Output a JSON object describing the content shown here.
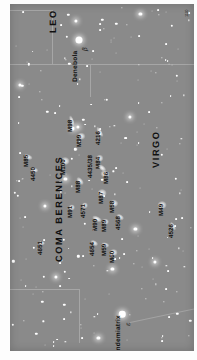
{
  "chart_data": {
    "type": "scatter",
    "xlabel": "",
    "ylabel": "",
    "grid": false,
    "legend": "none",
    "background_color": "#8a8a8a",
    "star_color": "#ffffff",
    "label_color": "#111111",
    "boundary_color": "#a6a6a6",
    "constellations": [
      {
        "name": "LEO",
        "x": 42,
        "y": 30
      },
      {
        "name": "COMA BERENICES",
        "x": 48,
        "y": 268
      },
      {
        "name": "VIRGO",
        "x": 152,
        "y": 170
      }
    ],
    "named_stars": [
      {
        "name": "Denebola",
        "greek": "β",
        "x": 74,
        "y": 37,
        "magnitude": 2.1,
        "size": 7.5
      },
      {
        "name": "Vindemiatrix",
        "greek": "ε",
        "x": 120,
        "y": 322,
        "magnitude": 2.8,
        "size": 7.0
      }
    ],
    "deep_sky_objects": [
      {
        "label": "M85",
        "x": 19,
        "y": 159,
        "gw": 7,
        "gh": 4,
        "rot": 20,
        "lx": 15,
        "ly": 169
      },
      {
        "label": "4450",
        "x": 26,
        "y": 172,
        "gw": 6,
        "gh": 4,
        "rot": 15,
        "lx": 22,
        "ly": 184
      },
      {
        "label": "4651",
        "x": 34,
        "y": 248,
        "gw": 5,
        "gh": 3,
        "rot": 10,
        "lx": 30,
        "ly": 260
      },
      {
        "label": "M98",
        "x": 66,
        "y": 121,
        "gw": 9,
        "gh": 3,
        "rot": 70,
        "lx": 62,
        "ly": 133
      },
      {
        "label": "M99",
        "x": 76,
        "y": 137,
        "gw": 6,
        "gh": 5,
        "rot": 0,
        "lx": 72,
        "ly": 148
      },
      {
        "label": "4216",
        "x": 96,
        "y": 133,
        "gw": 9,
        "gh": 3,
        "rot": 60,
        "lx": 92,
        "ly": 146
      },
      {
        "label": "M100",
        "x": 59,
        "y": 163,
        "gw": 7,
        "gh": 6,
        "rot": 0,
        "lx": 55,
        "ly": 177
      },
      {
        "label": "M84",
        "x": 96,
        "y": 160,
        "gw": 6,
        "gh": 5,
        "rot": 0,
        "lx": 92,
        "ly": 171
      },
      {
        "label": "4435/38",
        "x": 98,
        "y": 170,
        "gw": 7,
        "gh": 4,
        "rot": 40,
        "lx": 84,
        "ly": 180
      },
      {
        "label": "M86",
        "x": 102,
        "y": 176,
        "gw": 7,
        "gh": 5,
        "rot": 30,
        "lx": 101,
        "ly": 187
      },
      {
        "label": "M88",
        "x": 75,
        "y": 184,
        "gw": 7,
        "gh": 4,
        "rot": 50,
        "lx": 71,
        "ly": 196
      },
      {
        "label": "M87",
        "x": 99,
        "y": 196,
        "gw": 7,
        "gh": 6,
        "rot": 0,
        "lx": 95,
        "ly": 207
      },
      {
        "label": "M91",
        "x": 66,
        "y": 211,
        "gw": 5,
        "gh": 4,
        "rot": 0,
        "lx": 62,
        "ly": 222
      },
      {
        "label": "4571",
        "x": 80,
        "y": 209,
        "gw": 5,
        "gh": 4,
        "rot": 0,
        "lx": 76,
        "ly": 222
      },
      {
        "label": "M58",
        "x": 111,
        "y": 206,
        "gw": 6,
        "gh": 5,
        "rot": 20,
        "lx": 107,
        "ly": 217
      },
      {
        "label": "M90",
        "x": 93,
        "y": 223,
        "gw": 8,
        "gh": 4,
        "rot": 25,
        "lx": 89,
        "ly": 235
      },
      {
        "label": "M89",
        "x": 102,
        "y": 226,
        "gw": 5,
        "gh": 5,
        "rot": 0,
        "lx": 98,
        "ly": 237
      },
      {
        "label": "4568",
        "x": 118,
        "y": 221,
        "gw": 6,
        "gh": 4,
        "rot": 35,
        "lx": 114,
        "ly": 234
      },
      {
        "label": "4654",
        "x": 90,
        "y": 248,
        "gw": 6,
        "gh": 4,
        "rot": 30,
        "lx": 86,
        "ly": 261
      },
      {
        "label": "M59",
        "x": 102,
        "y": 250,
        "gw": 6,
        "gh": 4,
        "rot": 15,
        "lx": 98,
        "ly": 261
      },
      {
        "label": "M60",
        "x": 111,
        "y": 258,
        "gw": 7,
        "gh": 6,
        "rot": 0,
        "lx": 107,
        "ly": 269
      },
      {
        "label": "M49",
        "x": 163,
        "y": 209,
        "gw": 7,
        "gh": 6,
        "rot": 0,
        "lx": 159,
        "ly": 220
      },
      {
        "label": "4526",
        "x": 174,
        "y": 230,
        "gw": 7,
        "gh": 3,
        "rot": 60,
        "lx": 170,
        "ly": 243
      }
    ],
    "boundaries": [
      {
        "orientation": "h",
        "x": 0,
        "y": 62,
        "length": 140
      },
      {
        "orientation": "h",
        "x": 140,
        "y": 62,
        "length": 57
      },
      {
        "orientation": "v",
        "x": 86,
        "y": 62,
        "length": 34
      },
      {
        "orientation": "h",
        "x": 0,
        "y": 6,
        "length": 45
      },
      {
        "orientation": "v",
        "x": 45,
        "y": 6,
        "length": 56
      },
      {
        "orientation": "h",
        "x": 0,
        "y": 296,
        "length": 74
      },
      {
        "orientation": "v",
        "x": 74,
        "y": 296,
        "length": 56
      }
    ],
    "ecliptic": {
      "x1": 128,
      "y1": 330,
      "x2": 197,
      "y2": 316
    },
    "corner_mark": "1110"
  }
}
